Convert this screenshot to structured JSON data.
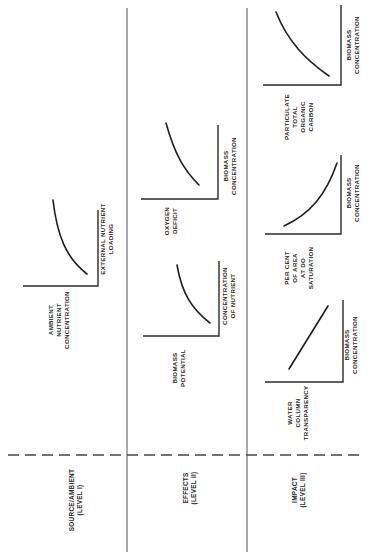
{
  "diagram": {
    "orientation": "rotated-90-ccw",
    "levels": [
      {
        "id": "level1",
        "label_line1": "SOURCE/AMBIENT",
        "label_line2": "(LEVEL I)",
        "charts": [
          {
            "y_label": [
              "AMBIENT",
              "NUTRIENT",
              "CONCENTRATION"
            ],
            "x_label": [
              "EXTERNAL NUTRIENT",
              "LOADING"
            ],
            "curve": "concave-increasing"
          }
        ]
      },
      {
        "id": "level2",
        "label_line1": "EFFECTS",
        "label_line2": "(LEVEL II)",
        "charts": [
          {
            "y_label": [
              "BIOMASS",
              "POTENTIAL"
            ],
            "x_label": [
              "CONCENTRATION",
              "OF NUTRIENT"
            ],
            "curve": "concave-increasing"
          },
          {
            "y_label": [
              "OXYGEN",
              "DEFICIT"
            ],
            "x_label": [
              "BIOMASS",
              "CONCENTRATION"
            ],
            "curve": "concave-increasing"
          }
        ]
      },
      {
        "id": "level3",
        "label_line1": "IMPACT",
        "label_line2": "(LEVEL III)",
        "charts": [
          {
            "y_label": [
              "WATER",
              "COLUMN",
              "TRANSPARENCY"
            ],
            "x_label": [
              "BIOMASS",
              "CONCENTRATION"
            ],
            "curve": "linear-increasing"
          },
          {
            "y_label": [
              "PER CENT",
              "OF AREA",
              "AT DO",
              "SATURATION"
            ],
            "x_label": [
              "BIOMASS",
              "CONCENTRATION"
            ],
            "curve": "convex-increasing"
          },
          {
            "y_label": [
              "PARTICULATE",
              "TOTAL",
              "ORGANIC",
              "CARBON"
            ],
            "x_label": [
              "BIOMASS",
              "CONCENTRATION"
            ],
            "curve": "concave-increasing"
          }
        ]
      }
    ]
  }
}
